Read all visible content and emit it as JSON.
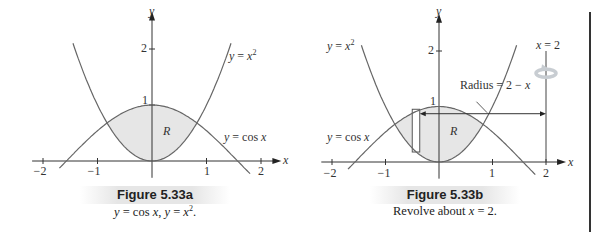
{
  "figures": [
    {
      "id": "5.33a",
      "title": "Figure 5.33a",
      "caption": "y = cos x, y = x².",
      "caption_parts": {
        "a": "y",
        "b": " = cos ",
        "c": "x",
        "d": ", ",
        "e": "y",
        "f": " = ",
        "g": "x",
        "sup": "2",
        "h": "."
      },
      "axis": {
        "x_label": "x",
        "y_label": "y"
      },
      "x_ticks": [
        "−2",
        "−1",
        "1",
        "2"
      ],
      "y_ticks": [
        "1",
        "2"
      ],
      "curve_labels": {
        "parabola": {
          "lhs": "y",
          "eq": " = ",
          "var": "x",
          "sup": "2"
        },
        "cosine": {
          "lhs": "y",
          "eq": " = cos ",
          "var": "x"
        }
      },
      "region_label": "R"
    },
    {
      "id": "5.33b",
      "title": "Figure 5.33b",
      "caption_parts": {
        "a": "Revolve about ",
        "b": "x",
        "c": " = 2."
      },
      "axis": {
        "x_label": "x",
        "y_label": "y"
      },
      "x_ticks": [
        "−2",
        "−1",
        "1",
        "2"
      ],
      "y_ticks": [
        "1",
        "2"
      ],
      "curve_labels": {
        "parabola": {
          "lhs": "y",
          "eq": " = ",
          "var": "x",
          "sup": "2"
        },
        "cosine": {
          "lhs": "y",
          "eq": " = cos ",
          "var": "x"
        }
      },
      "region_label": "R",
      "axis_of_revolution": {
        "var": "x",
        "rest": " = 2"
      },
      "radius_label": {
        "text": "Radius = 2 − ",
        "var": "x"
      }
    }
  ],
  "chart_data": [
    {
      "type": "line",
      "title": "Figure 5.33a",
      "subtitle": "y = cos x, y = x^2.",
      "xlabel": "x",
      "ylabel": "y",
      "xlim": [
        -2.2,
        2.3
      ],
      "ylim": [
        -0.3,
        2.6
      ],
      "x_ticks": [
        -2,
        -1,
        1,
        2
      ],
      "y_ticks": [
        1,
        2
      ],
      "series": [
        {
          "name": "y = x^2",
          "function": "x^2",
          "domain": [
            -1.45,
            1.45
          ]
        },
        {
          "name": "y = cos x",
          "function": "cos(x)",
          "domain": [
            -1.7,
            1.8
          ]
        }
      ],
      "shaded_region": {
        "label": "R",
        "between": [
          "x^2",
          "cos(x)"
        ],
        "x_range": [
          -0.824,
          0.824
        ],
        "fill": "#e6e6e6"
      },
      "intersections": [
        [
          -0.824,
          0.679
        ],
        [
          0.824,
          0.679
        ]
      ],
      "grid": false
    },
    {
      "type": "line",
      "title": "Figure 5.33b",
      "subtitle": "Revolve about x = 2.",
      "xlabel": "x",
      "ylabel": "y",
      "xlim": [
        -2.2,
        2.3
      ],
      "ylim": [
        -0.3,
        2.6
      ],
      "x_ticks": [
        -2,
        -1,
        1,
        2
      ],
      "y_ticks": [
        1,
        2
      ],
      "series": [
        {
          "name": "y = x^2",
          "function": "x^2",
          "domain": [
            -1.45,
            1.45
          ]
        },
        {
          "name": "y = cos x",
          "function": "cos(x)",
          "domain": [
            -1.7,
            1.8
          ]
        },
        {
          "name": "x = 2",
          "type": "vertical_line",
          "x": 2,
          "y_range": [
            0,
            2
          ]
        }
      ],
      "shaded_region": {
        "label": "R",
        "between": [
          "x^2",
          "cos(x)"
        ],
        "x_range": [
          -0.824,
          0.824
        ],
        "fill": "#e6e6e6"
      },
      "slice_rectangle": {
        "x_range": [
          -0.5,
          -0.36
        ],
        "y_range": [
          0.18,
          0.95
        ]
      },
      "radius_arrow": {
        "from_x": -0.36,
        "to_x": 2,
        "y": 0.87,
        "label": "Radius = 2 - x"
      },
      "annotation": "rotation arrow around x = 2",
      "grid": false
    }
  ]
}
